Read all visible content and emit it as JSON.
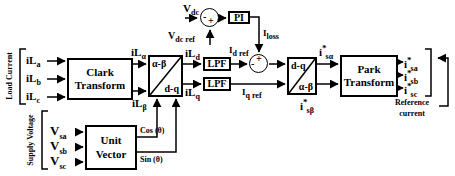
{
  "diagram": {
    "type": "control-block-diagram",
    "colors": {
      "line": "#000000",
      "background": "#ffffff",
      "text": "#000000"
    },
    "groups": {
      "load_current": {
        "label": "Load Current"
      },
      "supply_voltage": {
        "label": "Supply Voltage"
      },
      "reference_current": {
        "line1": "Reference",
        "line2": "current"
      }
    },
    "blocks": {
      "clark": {
        "line1": "Clark",
        "line2": "Transform"
      },
      "alphabeta_dq": {
        "top_left": "α-β",
        "bottom_right": "d-q"
      },
      "lpf_top": {
        "label": "LPF"
      },
      "lpf_bottom": {
        "label": "LPF"
      },
      "pi": {
        "label": "PI"
      },
      "dq_alphabeta": {
        "top_left": "d-q",
        "bottom_right": "α-β"
      },
      "park": {
        "line1": "Park",
        "line2": "Transform"
      },
      "unit_vector": {
        "line1": "Unit",
        "line2": "Vector"
      }
    },
    "summers": {
      "vdc_summer": {
        "left_sign": "-",
        "bottom_sign": "+"
      },
      "id_summer": {
        "top_sign": "+",
        "left_sign": "-"
      }
    },
    "signals": {
      "il_a": {
        "base": "iL",
        "sub": "a"
      },
      "il_b": {
        "base": "iL",
        "sub": "b"
      },
      "il_c": {
        "base": "iL",
        "sub": "c"
      },
      "il_alpha": {
        "base": "iL",
        "sub": "α"
      },
      "il_beta": {
        "base": "iL",
        "sub": "β"
      },
      "il_d": {
        "base": "iL",
        "sub": "d"
      },
      "il_q": {
        "base": "iL",
        "sub": "q"
      },
      "v_sa": {
        "base": "V",
        "sub": "sa"
      },
      "v_sb": {
        "base": "V",
        "sub": "sb"
      },
      "v_sc": {
        "base": "V",
        "sub": "sc"
      },
      "v_dc": {
        "base": "V",
        "sub": "dc"
      },
      "v_dc_ref": {
        "base": "V",
        "sub": "dc ref"
      },
      "i_loss": {
        "base": "I",
        "sub": "loss"
      },
      "i_d_ref": {
        "base": "I",
        "sub": "d ref"
      },
      "i_q_ref": {
        "base": "I",
        "sub": "q ref"
      },
      "cos_theta": {
        "text": "Cos (θ)"
      },
      "sin_theta": {
        "text": "Sin (θ)"
      },
      "is_alpha": {
        "base": "i",
        "sup": "*",
        "sub": "sα"
      },
      "is_beta": {
        "base": "i",
        "sup": "*",
        "sub": "sβ"
      },
      "is_a": {
        "base": "i",
        "sup": "*",
        "sub": "sa"
      },
      "is_b": {
        "base": "i",
        "sup": "*",
        "sub": "sb"
      },
      "is_c": {
        "base": "i",
        "sup": "*",
        "sub": "sc"
      }
    }
  }
}
